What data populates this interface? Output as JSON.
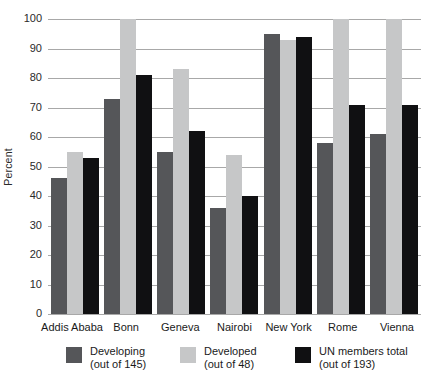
{
  "colors": {
    "gridline": "#a8a8a8",
    "axis_text": "#2a2a2a",
    "developing": "#555659",
    "developed": "#c6c7c8",
    "un_members_total": "#101012"
  },
  "chart_data": {
    "type": "bar",
    "title": "",
    "xlabel": "",
    "ylabel": "Percent",
    "ylim": [
      0,
      100
    ],
    "y_ticks": [
      0,
      10,
      20,
      30,
      40,
      50,
      60,
      70,
      80,
      90,
      100
    ],
    "grid": true,
    "legend_position": "bottom",
    "categories": [
      "Addis Ababa",
      "Bonn",
      "Geneva",
      "Nairobi",
      "New York",
      "Rome",
      "Vienna"
    ],
    "series": [
      {
        "name": "Developing",
        "sublabel": "(out of 145)",
        "key": "developing",
        "color": "#555659",
        "values": [
          46,
          73,
          55,
          36,
          95,
          58,
          61
        ]
      },
      {
        "name": "Developed",
        "sublabel": "(out of 48)",
        "key": "developed",
        "color": "#c6c7c8",
        "values": [
          55,
          100,
          83,
          54,
          93,
          100,
          100
        ]
      },
      {
        "name": "UN members total",
        "sublabel": "(out of 193)",
        "key": "un-members-total",
        "color": "#101012",
        "values": [
          53,
          81,
          62,
          40,
          94,
          71,
          71
        ]
      }
    ]
  }
}
